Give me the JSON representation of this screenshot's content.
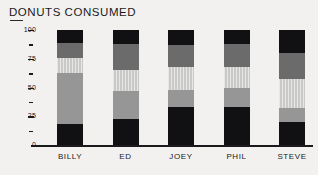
{
  "chart_data": {
    "type": "bar",
    "variant": "stacked",
    "title": "DONUTS CONSUMED",
    "xlabel": "",
    "ylabel": "",
    "ylim": [
      0,
      100
    ],
    "grid": false,
    "legend": "none",
    "y_ticks_major": [
      "0",
      "25",
      "50",
      "75",
      "100"
    ],
    "y_tick_values_major": [
      0,
      25,
      50,
      75,
      100
    ],
    "y_tick_values_minor": [
      12.5,
      37.5,
      62.5,
      87.5
    ],
    "categories": [
      "BILLY",
      "ED",
      "JOEY",
      "PHIL",
      "STEVE"
    ],
    "series": [
      {
        "name": "segment-1-black",
        "color": "#111113",
        "values": [
          18,
          23,
          33,
          33,
          20
        ]
      },
      {
        "name": "segment-2-medium",
        "color": "#969696",
        "values": [
          45,
          24,
          15,
          17,
          12
        ]
      },
      {
        "name": "segment-3-light",
        "color": "#c9c9c7",
        "values": [
          13,
          18,
          20,
          18,
          25
        ]
      },
      {
        "name": "segment-4-dark",
        "color": "#6b6b6b",
        "values": [
          13,
          23,
          19,
          20,
          23
        ]
      },
      {
        "name": "segment-5-black",
        "color": "#111113",
        "values": [
          11,
          12,
          13,
          12,
          20
        ]
      }
    ],
    "bars": [
      {
        "category": "BILLY",
        "total": 100,
        "segments": [
          {
            "layer": 1,
            "style": "black",
            "value": 18,
            "from": 0,
            "to": 18
          },
          {
            "layer": 2,
            "style": "medium",
            "value": 45,
            "from": 18,
            "to": 63
          },
          {
            "layer": 3,
            "style": "light",
            "value": 13,
            "from": 63,
            "to": 76
          },
          {
            "layer": 4,
            "style": "dark",
            "value": 13,
            "from": 76,
            "to": 89
          },
          {
            "layer": 5,
            "style": "black",
            "value": 11,
            "from": 89,
            "to": 100
          }
        ]
      },
      {
        "category": "ED",
        "total": 100,
        "segments": [
          {
            "layer": 1,
            "style": "black",
            "value": 23,
            "from": 0,
            "to": 23
          },
          {
            "layer": 2,
            "style": "medium",
            "value": 24,
            "from": 23,
            "to": 47
          },
          {
            "layer": 3,
            "style": "light",
            "value": 18,
            "from": 47,
            "to": 65
          },
          {
            "layer": 4,
            "style": "dark",
            "value": 23,
            "from": 65,
            "to": 88
          },
          {
            "layer": 5,
            "style": "black",
            "value": 12,
            "from": 88,
            "to": 100
          }
        ]
      },
      {
        "category": "JOEY",
        "total": 100,
        "segments": [
          {
            "layer": 1,
            "style": "black",
            "value": 33,
            "from": 0,
            "to": 33
          },
          {
            "layer": 2,
            "style": "medium",
            "value": 15,
            "from": 33,
            "to": 48
          },
          {
            "layer": 3,
            "style": "light",
            "value": 20,
            "from": 48,
            "to": 68
          },
          {
            "layer": 4,
            "style": "dark",
            "value": 19,
            "from": 68,
            "to": 87
          },
          {
            "layer": 5,
            "style": "black",
            "value": 13,
            "from": 87,
            "to": 100
          }
        ]
      },
      {
        "category": "PHIL",
        "total": 100,
        "segments": [
          {
            "layer": 1,
            "style": "black",
            "value": 33,
            "from": 0,
            "to": 33
          },
          {
            "layer": 2,
            "style": "medium",
            "value": 17,
            "from": 33,
            "to": 50
          },
          {
            "layer": 3,
            "style": "light",
            "value": 18,
            "from": 50,
            "to": 68
          },
          {
            "layer": 4,
            "style": "dark",
            "value": 20,
            "from": 68,
            "to": 88
          },
          {
            "layer": 5,
            "style": "black",
            "value": 12,
            "from": 88,
            "to": 100
          }
        ]
      },
      {
        "category": "STEVE",
        "total": 100,
        "segments": [
          {
            "layer": 1,
            "style": "black",
            "value": 20,
            "from": 0,
            "to": 20
          },
          {
            "layer": 2,
            "style": "medium",
            "value": 12,
            "from": 20,
            "to": 32
          },
          {
            "layer": 3,
            "style": "light",
            "value": 25,
            "from": 32,
            "to": 57
          },
          {
            "layer": 4,
            "style": "dark",
            "value": 23,
            "from": 57,
            "to": 80
          },
          {
            "layer": 5,
            "style": "black",
            "value": 20,
            "from": 80,
            "to": 100
          }
        ]
      }
    ],
    "colors": {
      "background": "#f2f1ef",
      "axis": "#1a1a1d",
      "text": "#1a1a1d",
      "black": "#111113",
      "dark_gray": "#6b6b6b",
      "medium_gray": "#969696",
      "light_gray": "#c9c9c7"
    }
  }
}
